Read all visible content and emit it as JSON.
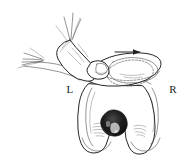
{
  "figure": {
    "background_color": "#ffffff",
    "ink_color": "#2b2b2b",
    "shadow_color": "#1a1a1a",
    "width": 188,
    "height": 162
  },
  "labels": {
    "left_condyle": "L",
    "right_condyle": "R"
  },
  "annotations": {
    "direction_arrow": "arrow-right",
    "arrow_meaning": "lateral translation of patella",
    "dashed_outline_meaning": "displaced patella position"
  },
  "parts": {
    "hand": "examiner-hand",
    "thumb": "thumb-pressing-patella",
    "thumbnail": "thumbnail",
    "fingers": "extended-fingers",
    "forearm": "forearm",
    "patella": "patella",
    "femur": "distal-femur",
    "condyle_left": "medial-condyle",
    "condyle_right": "lateral-condyle",
    "notch": "intercondylar-notch"
  }
}
